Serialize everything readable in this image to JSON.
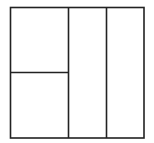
{
  "diagram": {
    "type": "partitioned-square",
    "stroke_color": "#222222",
    "background_color": "#ffffff",
    "stroke_width": 1.6,
    "outer": {
      "x": 10.5,
      "y": 7.5,
      "width": 133.5,
      "height": 130.5
    },
    "lines": [
      {
        "name": "vertical-divider-1",
        "x1": 68.5,
        "y1": 7.5,
        "x2": 68.5,
        "y2": 138
      },
      {
        "name": "vertical-divider-2",
        "x1": 106.5,
        "y1": 7.5,
        "x2": 106.5,
        "y2": 138
      },
      {
        "name": "horizontal-divider",
        "x1": 10.5,
        "y1": 72.5,
        "x2": 68.5,
        "y2": 72.5
      }
    ],
    "regions": [
      {
        "name": "region-top-left",
        "x": 10.5,
        "y": 7.5,
        "width": 58,
        "height": 65
      },
      {
        "name": "region-bottom-left",
        "x": 10.5,
        "y": 72.5,
        "width": 58,
        "height": 65.5
      },
      {
        "name": "region-middle-column",
        "x": 68.5,
        "y": 7.5,
        "width": 38,
        "height": 130.5
      },
      {
        "name": "region-right-column",
        "x": 106.5,
        "y": 7.5,
        "width": 37.5,
        "height": 130.5
      }
    ]
  }
}
